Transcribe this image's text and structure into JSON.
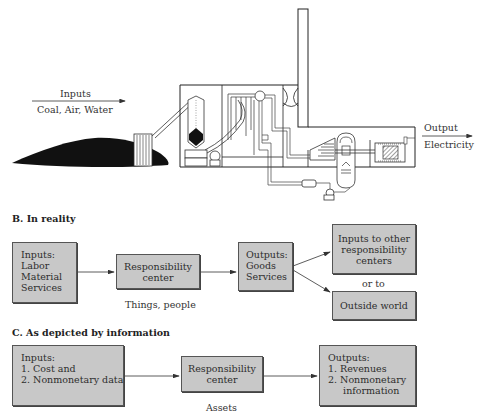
{
  "section_a": {
    "inputs_label": "Inputs",
    "inputs_detail": "Coal, Air, Water",
    "output_label": "Output",
    "output_detail": "Electricity",
    "illustration": "coal-fired-power-plant"
  },
  "section_b": {
    "title": "B.  In reality",
    "inputs_box": {
      "lines": [
        "Inputs:",
        "Labor",
        "Material",
        "Services"
      ]
    },
    "center_box": {
      "lines": [
        "Responsibility",
        "center"
      ]
    },
    "center_caption": "Things, people",
    "outputs_box": {
      "lines": [
        "Outputs:",
        "Goods",
        "Services"
      ]
    },
    "other_centers_box": {
      "lines": [
        "Inputs to other",
        "responsibility",
        "centers"
      ]
    },
    "or_to": "or to",
    "outside_box": {
      "lines": [
        "Outside world"
      ]
    }
  },
  "section_c": {
    "title": "C.  As depicted by information",
    "inputs_box": {
      "lines": [
        "Inputs:",
        "1.  Cost and",
        "2.  Nonmonetary data"
      ]
    },
    "center_box": {
      "lines": [
        "Responsibility",
        "center"
      ]
    },
    "center_caption": "Assets",
    "outputs_box": {
      "lines": [
        "Outputs:",
        "1.  Revenues",
        "2.  Nonmonetary",
        "     information"
      ]
    }
  },
  "colors": {
    "box_fill": "#c8c8c8",
    "box_border": "#555555",
    "line": "#333333",
    "coal": "#111111"
  }
}
